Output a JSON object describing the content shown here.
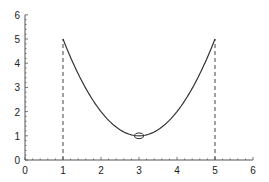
{
  "chart_data": {
    "type": "line",
    "title": "",
    "xlabel": "",
    "ylabel": "",
    "xlim": [
      0,
      6
    ],
    "ylim": [
      0,
      6
    ],
    "grid": false,
    "legend": null,
    "x_ticks": [
      "0",
      "1",
      "2",
      "3",
      "4",
      "5",
      "6"
    ],
    "y_ticks": [
      "0",
      "1",
      "2",
      "3",
      "4",
      "5",
      "6"
    ],
    "series": [
      {
        "name": "curve",
        "function": "y = (x - 3)^2 + 1",
        "x": [
          1,
          1.5,
          2,
          2.5,
          3,
          3.5,
          4,
          4.5,
          5
        ],
        "y": [
          5,
          3.25,
          2,
          1.25,
          1,
          1.25,
          2,
          3.25,
          5
        ],
        "style": "solid",
        "color": "#333333"
      }
    ],
    "annotations": [
      {
        "type": "vertical-dashed-line",
        "x": 1,
        "y_from": 0,
        "y_to": 5
      },
      {
        "type": "vertical-dashed-line",
        "x": 5,
        "y_from": 0,
        "y_to": 5
      },
      {
        "type": "open-ellipse-marker",
        "x": 3,
        "y": 1,
        "label": "minimum"
      }
    ]
  },
  "style": {
    "axis_color": "#555555",
    "curve_color": "#333333",
    "dash_color": "#444444",
    "background": "#ffffff"
  }
}
